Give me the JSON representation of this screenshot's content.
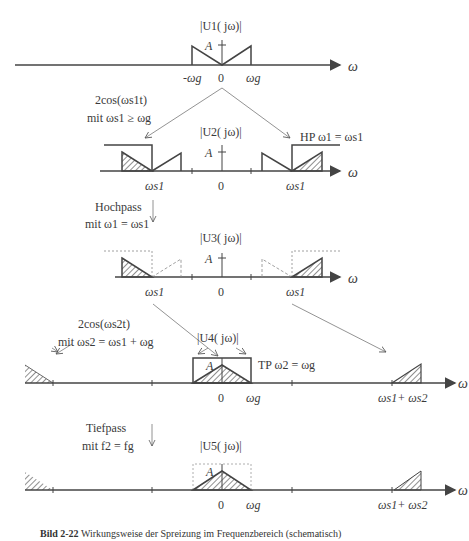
{
  "figure": {
    "caption_number": "Bild 2-22",
    "caption_text": "Wirkungsweise der Spreizung im Frequenzbereich (schematisch)",
    "axis_symbol": "ω",
    "amplitude_label": "A",
    "zero_label": "0"
  },
  "panels": [
    {
      "id": "u1",
      "title": "|U1( jω)|",
      "ticks": [
        "-ωg",
        "0",
        "ωg"
      ]
    },
    {
      "id": "u2",
      "title": "|U2( jω)|",
      "ticks": [
        "ωs1",
        "0",
        "ωs1"
      ],
      "filter_label": "HP ω1 = ωs1"
    },
    {
      "id": "u3",
      "title": "|U3( jω)|",
      "ticks": [
        "ωs1",
        "0",
        "ωs1"
      ]
    },
    {
      "id": "u4",
      "title": "|U4( jω)|",
      "ticks": [
        "0",
        "ωg",
        "ωs1+ ωs2"
      ],
      "filter_label": "TP ω2 = ωg"
    },
    {
      "id": "u5",
      "title": "|U5( jω)|",
      "ticks": [
        "0",
        "ωg",
        "ωs1+ ωs2"
      ]
    }
  ],
  "annotations": {
    "mix1_line1": "2cos(ωs1t)",
    "mix1_line2": "mit ωs1 ≥ ωg",
    "hp_line1": "Hochpass",
    "hp_line2": "mit ω1 = ωs1",
    "mix2_line1": "2cos(ωs2t)",
    "mix2_line2": "mit ωs2 = ωs1 + ωg",
    "tp_line1": "Tiefpass",
    "tp_line2": "mit f2 = fg"
  }
}
